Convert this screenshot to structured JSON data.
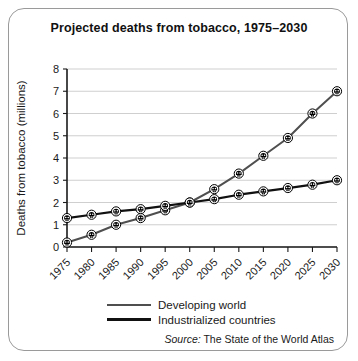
{
  "chart_data": {
    "type": "line",
    "title": "Projected deaths from tobacco, 1975–2030",
    "xlabel": "",
    "ylabel": "Deaths from tobacco (millions)",
    "categories": [
      1975,
      1980,
      1985,
      1990,
      1995,
      2000,
      2005,
      2010,
      2015,
      2020,
      2025,
      2030
    ],
    "x_tick_labels": [
      "1975",
      "1980",
      "1985",
      "1990",
      "1995",
      "2000",
      "2005",
      "2010",
      "2015",
      "2020",
      "2025",
      "2030"
    ],
    "y_tick_labels": [
      "0",
      "1",
      "2",
      "3",
      "4",
      "5",
      "6",
      "7",
      "8"
    ],
    "ylim": [
      0,
      8
    ],
    "xlim": [
      1975,
      2030
    ],
    "grid": "horizontal",
    "legend_position": "bottom-center",
    "marker": "skull-icon",
    "series": [
      {
        "name": "Developing world",
        "color": "#4f4f4f",
        "line_width": 2.0,
        "values": [
          0.2,
          0.55,
          1.0,
          1.3,
          1.65,
          2.0,
          2.6,
          3.3,
          4.1,
          4.9,
          6.0,
          7.0
        ]
      },
      {
        "name": "Industrialized countries",
        "color": "#111111",
        "line_width": 2.2,
        "values": [
          1.3,
          1.45,
          1.6,
          1.7,
          1.85,
          2.0,
          2.15,
          2.35,
          2.5,
          2.65,
          2.8,
          3.0
        ]
      }
    ],
    "annotations": []
  },
  "legend": {
    "items": [
      {
        "label": "Developing world",
        "style": "developing"
      },
      {
        "label": "Industrialized countries",
        "style": "industrialized"
      }
    ]
  },
  "source": {
    "prefix": "Source:",
    "text": " The State of the World Atlas"
  },
  "colors": {
    "frame": "#9a9a9a",
    "grid": "#c9c9c9",
    "axis": "#1a1a1a",
    "background": "#ffffff"
  }
}
